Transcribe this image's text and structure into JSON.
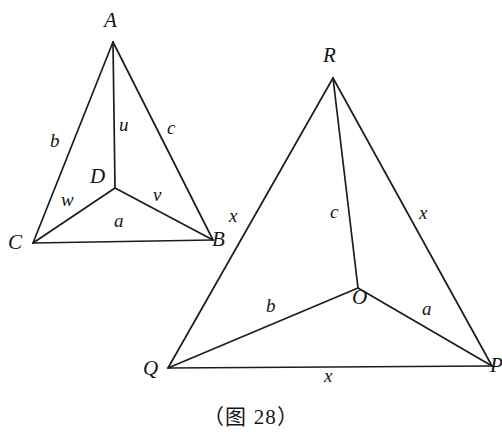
{
  "figure": {
    "caption": "（图 28）",
    "background_color": "#ffffff",
    "stroke_color": "#1c1c1c",
    "text_color": "#141414",
    "width": 502,
    "height": 442
  },
  "left_figure": {
    "name": "triangle-abc-with-interior-point-d",
    "vertices": [
      {
        "id": "A",
        "label": "A",
        "x": 113,
        "y": 42,
        "label_x": 104,
        "label_y": 10
      },
      {
        "id": "C",
        "label": "C",
        "x": 33,
        "y": 243,
        "label_x": 8,
        "label_y": 232
      },
      {
        "id": "B",
        "label": "B",
        "x": 213,
        "y": 240,
        "label_x": 212,
        "label_y": 229
      },
      {
        "id": "D",
        "label": "D",
        "x": 115,
        "y": 188,
        "label_x": 90,
        "label_y": 166
      }
    ],
    "edges": [
      {
        "from": "A",
        "to": "C",
        "label": "b",
        "label_x": 50,
        "label_y": 131
      },
      {
        "from": "A",
        "to": "B",
        "label": "c",
        "label_x": 167,
        "label_y": 118
      },
      {
        "from": "C",
        "to": "B",
        "label": "a",
        "label_x": 114,
        "label_y": 211
      },
      {
        "from": "A",
        "to": "D",
        "label": "u",
        "label_x": 119,
        "label_y": 115
      },
      {
        "from": "D",
        "to": "C",
        "label": "w",
        "label_x": 61,
        "label_y": 190
      },
      {
        "from": "D",
        "to": "B",
        "label": "v",
        "label_x": 153,
        "label_y": 185
      }
    ]
  },
  "right_figure": {
    "name": "triangle-qrp-with-interior-point-o",
    "vertices": [
      {
        "id": "R",
        "label": "R",
        "x": 333,
        "y": 78,
        "label_x": 323,
        "label_y": 45
      },
      {
        "id": "Q",
        "label": "Q",
        "x": 168,
        "y": 368,
        "label_x": 143,
        "label_y": 358
      },
      {
        "id": "P",
        "label": "P",
        "x": 492,
        "y": 366,
        "label_x": 490,
        "label_y": 355
      },
      {
        "id": "O",
        "label": "O",
        "x": 358,
        "y": 288,
        "label_x": 352,
        "label_y": 287
      }
    ],
    "edges": [
      {
        "from": "R",
        "to": "Q",
        "label": "x",
        "label_x": 229,
        "label_y": 206
      },
      {
        "from": "R",
        "to": "P",
        "label": "x",
        "label_x": 419,
        "label_y": 203
      },
      {
        "from": "Q",
        "to": "P",
        "label": "x",
        "label_x": 324,
        "label_y": 366
      },
      {
        "from": "R",
        "to": "O",
        "label": "c",
        "label_x": 330,
        "label_y": 202
      },
      {
        "from": "O",
        "to": "Q",
        "label": "b",
        "label_x": 266,
        "label_y": 296
      },
      {
        "from": "O",
        "to": "P",
        "label": "a",
        "label_x": 422,
        "label_y": 299
      }
    ]
  }
}
